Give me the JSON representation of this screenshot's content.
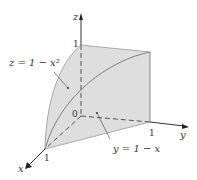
{
  "figure": {
    "axes": {
      "x_label": "x",
      "y_label": "y",
      "z_label": "z",
      "origin_label": "0",
      "x_tick": "1",
      "y_tick": "1",
      "z_tick": "1"
    },
    "annotations": {
      "surface_label": "z = 1 − x²",
      "plane_label": "y = 1 − x"
    },
    "colors": {
      "surface_fill": "#d9d9d9",
      "side_fill": "#e6e6e6",
      "edge": "#808080",
      "axis": "#333333"
    }
  }
}
